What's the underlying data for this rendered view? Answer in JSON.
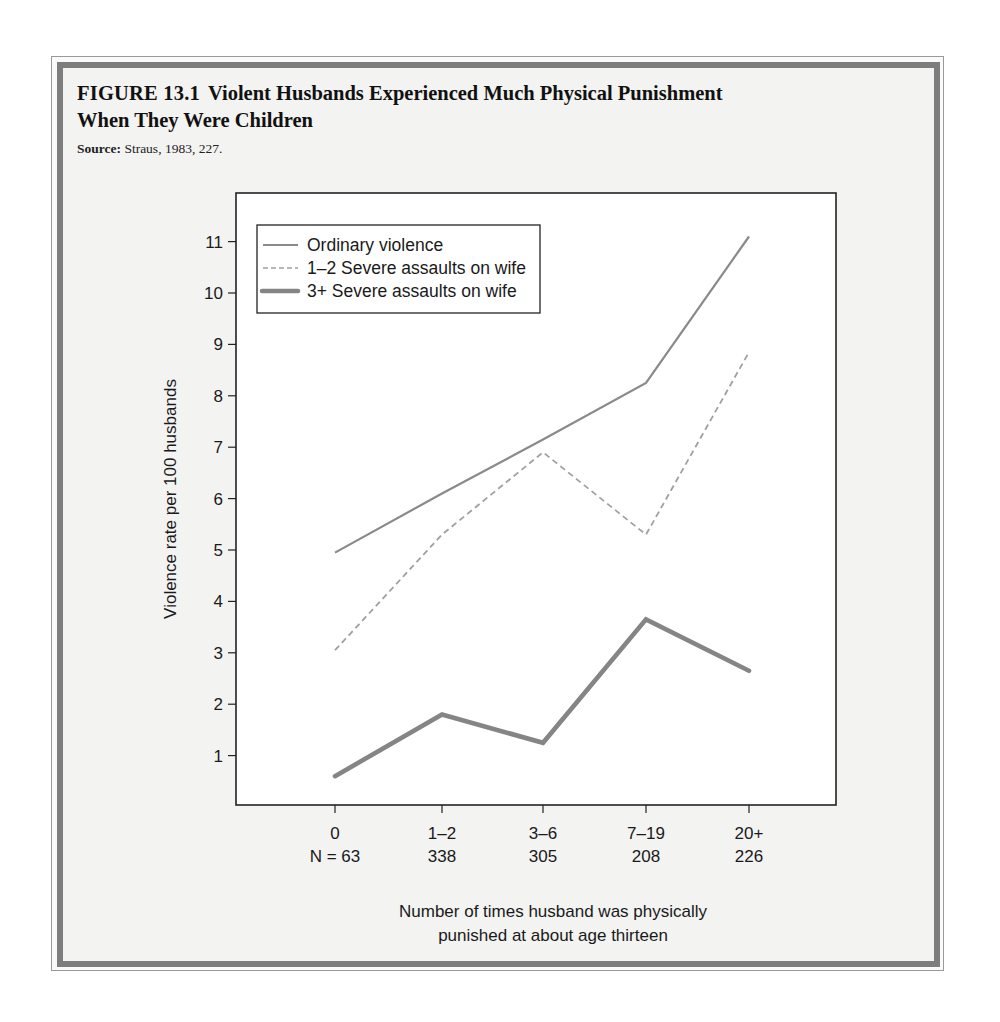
{
  "figure": {
    "number": "FIGURE 13.1",
    "title_line1": "Violent Husbands Experienced Much Physical Punishment",
    "title_line2": "When They Were Children",
    "source_label": "Source:",
    "source_text": " Straus, 1983, 227."
  },
  "colors": {
    "frame_band": "#7d7d7d",
    "frame_bg": "#f3f3f2",
    "plot_bg": "#ffffff",
    "axis": "#222222",
    "line_ordinary": "#8a8a8a",
    "line_dashed": "#a0a0a0",
    "line_thick": "#858585"
  },
  "chart_data": {
    "type": "line",
    "title": "Violent Husbands Experienced Much Physical Punishment When They Were Children",
    "xlabel": "Number of times husband was physically punished at about age thirteen",
    "ylabel": "Violence rate per 100 husbands",
    "categories": [
      "0",
      "1–2",
      "3–6",
      "7–19",
      "20+"
    ],
    "category_n": [
      "N = 63",
      "338",
      "305",
      "208",
      "226"
    ],
    "yticks": [
      1,
      2,
      3,
      4,
      5,
      6,
      7,
      8,
      9,
      10,
      11
    ],
    "ylim": [
      0,
      11.8
    ],
    "grid": false,
    "legend_position": "upper left (inside plot)",
    "series": [
      {
        "name": "Ordinary violence",
        "style": "solid-thin",
        "values": [
          4.95,
          6.1,
          7.15,
          8.25,
          11.1
        ]
      },
      {
        "name": "1–2 Severe assaults on wife",
        "style": "dashed",
        "values": [
          3.05,
          5.3,
          6.9,
          5.3,
          8.85
        ]
      },
      {
        "name": "3+ Severe assaults on wife",
        "style": "solid-thick",
        "values": [
          0.6,
          1.8,
          1.25,
          3.65,
          2.65
        ]
      }
    ]
  }
}
